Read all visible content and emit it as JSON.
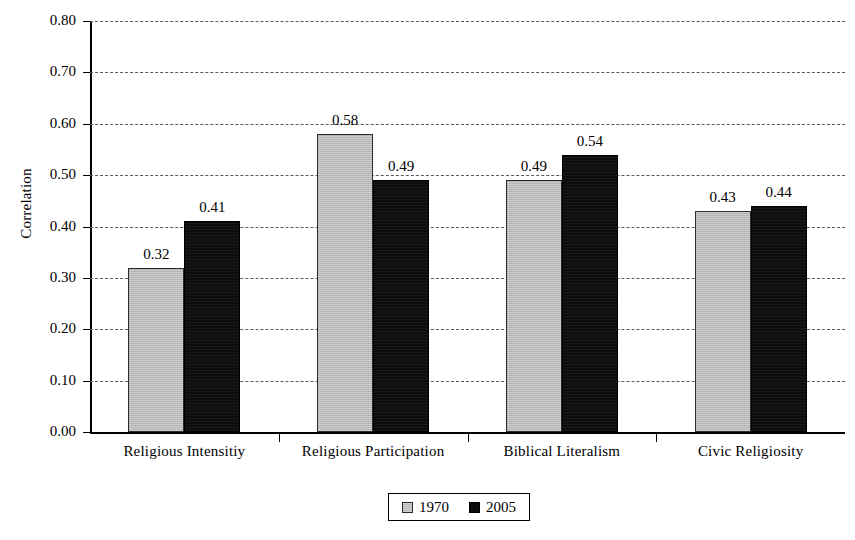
{
  "chart_data": {
    "type": "bar",
    "title": "",
    "subtitle": "",
    "xlabel": "",
    "ylabel": "Correlation",
    "ylim": [
      0.0,
      0.8
    ],
    "ytick_labels": [
      "0.00",
      "0.10",
      "0.20",
      "0.30",
      "0.40",
      "0.50",
      "0.60",
      "0.70",
      "0.80"
    ],
    "ytick_values": [
      0.0,
      0.1,
      0.2,
      0.3,
      0.4,
      0.5,
      0.6,
      0.7,
      0.8
    ],
    "grid": true,
    "grid_style": "dashed",
    "grid_axis": "y",
    "legend_position": "bottom-center",
    "categories": [
      "Religious Intensitiy",
      "Religious Participation",
      "Biblical Literalism",
      "Civic Religiosity"
    ],
    "series": [
      {
        "name": "1970",
        "color": "#b9b9b9",
        "values": [
          0.32,
          0.58,
          0.49,
          0.43
        ],
        "value_labels": [
          "0.32",
          "0.58",
          "0.49",
          "0.43"
        ]
      },
      {
        "name": "2005",
        "color": "#0d0d0d",
        "values": [
          0.41,
          0.49,
          0.54,
          0.44
        ],
        "value_labels": [
          "0.41",
          "0.49",
          "0.54",
          "0.44"
        ]
      }
    ]
  },
  "legend": {
    "items": [
      {
        "label": "1970",
        "swatch": "legend-swatch-1970"
      },
      {
        "label": "2005",
        "swatch": "legend-swatch-2005"
      }
    ]
  }
}
